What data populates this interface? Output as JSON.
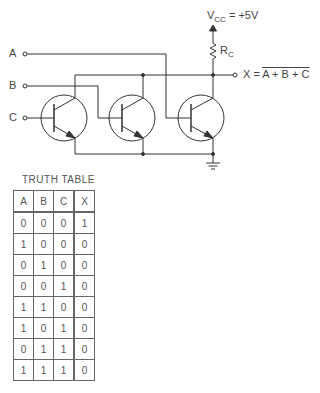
{
  "circuit": {
    "inputs": [
      {
        "label": "A"
      },
      {
        "label": "B"
      },
      {
        "label": "C"
      }
    ],
    "supply": {
      "label": "V",
      "sub": "CC",
      "value": " = +5V"
    },
    "resistor": {
      "label": "R",
      "sub": "C"
    },
    "output": {
      "prefix": "X = ",
      "expr": "A + B + C"
    }
  },
  "truth_table": {
    "title": "TRUTH TABLE",
    "headers": [
      "A",
      "B",
      "C",
      "X"
    ],
    "rows": [
      [
        "0",
        "0",
        "0",
        "1"
      ],
      [
        "1",
        "0",
        "0",
        "0"
      ],
      [
        "0",
        "1",
        "0",
        "0"
      ],
      [
        "0",
        "0",
        "1",
        "0"
      ],
      [
        "1",
        "1",
        "0",
        "0"
      ],
      [
        "1",
        "0",
        "1",
        "0"
      ],
      [
        "0",
        "1",
        "1",
        "0"
      ],
      [
        "1",
        "1",
        "1",
        "0"
      ]
    ]
  }
}
